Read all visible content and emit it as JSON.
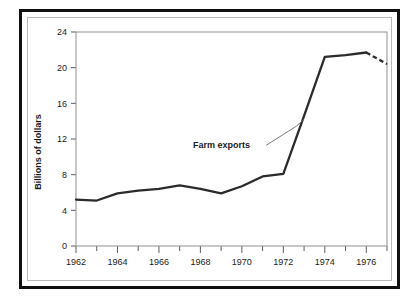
{
  "chart_data": {
    "type": "line",
    "title": "",
    "xlabel": "",
    "ylabel": "Billions of dollars",
    "xlim": [
      1962,
      1977
    ],
    "ylim": [
      0,
      24
    ],
    "grid": false,
    "legend_position": "none",
    "x": [
      1962,
      1963,
      1964,
      1965,
      1966,
      1967,
      1968,
      1969,
      1970,
      1971,
      1972,
      1973,
      1974,
      1975,
      1976,
      1977
    ],
    "series": [
      {
        "name": "Farm exports",
        "values": [
          5.2,
          5.1,
          5.9,
          6.2,
          6.4,
          6.8,
          6.4,
          5.9,
          6.7,
          7.8,
          8.1,
          14.6,
          21.2,
          21.4,
          21.7,
          20.4
        ],
        "style": "solid",
        "dashed_from_index": 14,
        "color": "#2b2b2b"
      }
    ],
    "x_ticks": [
      1962,
      1963,
      1964,
      1965,
      1966,
      1967,
      1968,
      1969,
      1970,
      1971,
      1972,
      1973,
      1974,
      1975,
      1976,
      1977
    ],
    "x_tick_labels": [
      "1962",
      "",
      "1964",
      "",
      "1966",
      "",
      "1968",
      "",
      "1970",
      "",
      "1972",
      "",
      "1974",
      "",
      "1976",
      ""
    ],
    "y_ticks": [
      0,
      4,
      8,
      12,
      16,
      20,
      24
    ],
    "y_tick_labels": [
      "0",
      "4",
      "8",
      "12",
      "16",
      "20",
      "24"
    ],
    "annotations": [
      {
        "text": "Farm exports",
        "target_x": 1973,
        "target_y": 14.2
      }
    ]
  },
  "axis": {
    "y_title": "Billions of dollars"
  },
  "colors": {
    "line": "#2b2b2b",
    "frame_outer": "#111111",
    "frame_inner": "#b9b9b9",
    "axis": "#8f8f8f",
    "background": "#ffffff"
  }
}
